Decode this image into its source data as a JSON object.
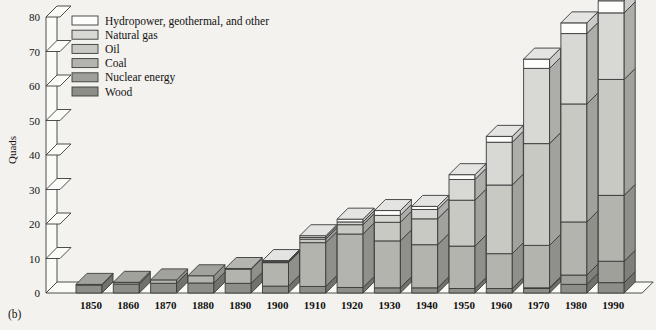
{
  "figure": {
    "panel_caption": "(b)",
    "y_axis_title": "Quads"
  },
  "legend": {
    "items": [
      {
        "label": "Hydropower, geothermal, and other",
        "key": "hydro",
        "color": "#fdfdfb"
      },
      {
        "label": "Natural gas",
        "key": "natural_gas",
        "color": "#d8d8d4"
      },
      {
        "label": "Oil",
        "key": "oil",
        "color": "#c9c9c4"
      },
      {
        "label": "Coal",
        "key": "coal",
        "color": "#b4b4ae"
      },
      {
        "label": "Nuclear energy",
        "key": "nuclear",
        "color": "#a0a09a"
      },
      {
        "label": "Wood",
        "key": "wood",
        "color": "#8e8e88"
      }
    ]
  },
  "chart_data": {
    "type": "bar",
    "stacked": true,
    "title": "",
    "subtitle": "",
    "xlabel": "",
    "ylabel": "Quads",
    "ylim": [
      0,
      80
    ],
    "yticks": [
      0,
      10,
      20,
      30,
      40,
      50,
      60,
      70,
      80
    ],
    "ytick_labels": [
      "0",
      "10",
      "20",
      "30",
      "40",
      "50",
      "60",
      "70",
      "80"
    ],
    "grid": false,
    "legend_position": "top-left",
    "categories": [
      "1850",
      "1860",
      "1870",
      "1880",
      "1890",
      "1900",
      "1910",
      "1920",
      "1930",
      "1940",
      "1950",
      "1960",
      "1970",
      "1980",
      "1990"
    ],
    "series": [
      {
        "name": "Wood",
        "key": "wood",
        "color": "#8e8e88",
        "values": [
          2.3,
          2.6,
          2.8,
          2.9,
          2.8,
          2.0,
          1.9,
          1.6,
          1.5,
          1.5,
          1.3,
          1.3,
          1.3,
          2.5,
          3.0
        ]
      },
      {
        "name": "Nuclear energy",
        "key": "nuclear",
        "color": "#a0a09a",
        "values": [
          0,
          0,
          0,
          0,
          0,
          0,
          0,
          0,
          0,
          0,
          0,
          0,
          0.2,
          2.7,
          6.2
        ]
      },
      {
        "name": "Coal",
        "key": "coal",
        "color": "#b4b4ae",
        "values": [
          0.2,
          0.5,
          1.0,
          2.1,
          4.1,
          6.8,
          12.7,
          15.5,
          13.6,
          12.5,
          12.3,
          10.1,
          12.3,
          15.4,
          19.1
        ]
      },
      {
        "name": "Oil",
        "key": "oil",
        "color": "#c9c9c4",
        "values": [
          0,
          0,
          0,
          0,
          0.2,
          0.2,
          1.0,
          2.7,
          5.4,
          7.5,
          13.3,
          19.9,
          29.5,
          34.2,
          33.6
        ]
      },
      {
        "name": "Natural gas",
        "key": "natural_gas",
        "color": "#d8d8d4",
        "values": [
          0,
          0,
          0,
          0,
          0,
          0.1,
          0.5,
          0.8,
          2.0,
          2.7,
          6.0,
          12.4,
          21.8,
          20.4,
          19.3
        ]
      },
      {
        "name": "Hydropower, geothermal, and other",
        "key": "hydro",
        "color": "#fdfdfb",
        "values": [
          0,
          0,
          0,
          0,
          0,
          0.3,
          0.5,
          0.8,
          1.4,
          0.9,
          1.4,
          1.7,
          2.7,
          3.1,
          3.5
        ]
      }
    ],
    "totals": [
      2.5,
      3.1,
      3.8,
      5.0,
      7.1,
      9.4,
      16.6,
      21.4,
      23.9,
      25.1,
      34.3,
      45.4,
      67.8,
      78.3,
      84.7
    ],
    "displayed_totals": [
      3,
      3,
      4,
      5,
      7,
      9,
      16,
      21,
      23,
      24,
      33,
      42,
      67,
      72,
      80
    ]
  }
}
